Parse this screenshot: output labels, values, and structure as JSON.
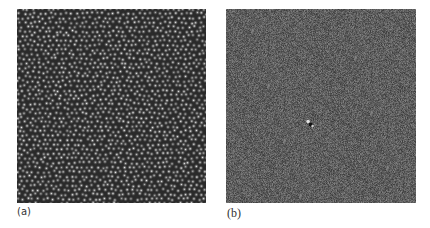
{
  "figure": {
    "panels": [
      {
        "id": "a",
        "label": "(a)",
        "description": "dense packing of bright circular particles on dark background",
        "background": "#3a3a3a",
        "particle_color": "#d8d8d8"
      },
      {
        "id": "b",
        "label": "(b)",
        "description": "gray noise field with a single small dark/bright feature near center",
        "background": "#6e6e6e",
        "feature_position": [
          0.44,
          0.59
        ]
      }
    ]
  }
}
